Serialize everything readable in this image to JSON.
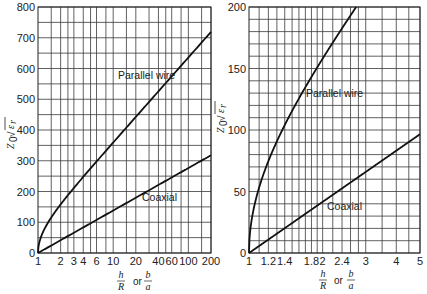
{
  "chart_data": [
    {
      "type": "line",
      "title": "",
      "xlabel": "h/R or b/a",
      "ylabel": "Z0 √εr",
      "xscale": "log",
      "xlim": [
        1,
        200
      ],
      "ylim": [
        0,
        800
      ],
      "grid": true,
      "x_tick_labels": [
        "1",
        "2",
        "3",
        "4",
        "6",
        "10",
        "20",
        "40",
        "60",
        "100",
        "200"
      ],
      "y_tick_labels": [
        "0",
        "100",
        "200",
        "300",
        "400",
        "500",
        "600",
        "700",
        "800"
      ],
      "annotations": [
        "Parallel wire",
        "Coaxial"
      ],
      "x": [
        1,
        1.1,
        1.2,
        1.5,
        2,
        3,
        4,
        6,
        10,
        20,
        40,
        60,
        100,
        200
      ],
      "series": [
        {
          "name": "Parallel wire",
          "values": [
            0,
            53,
            75,
            116,
            158,
            211,
            247,
            297,
            359,
            442,
            525,
            574,
            635,
            718
          ]
        },
        {
          "name": "Coaxial",
          "values": [
            0,
            6,
            11,
            24,
            42,
            66,
            83,
            108,
            138,
            180,
            221,
            246,
            276,
            318
          ]
        }
      ]
    },
    {
      "type": "line",
      "title": "",
      "xlabel": "h/R or b/a",
      "ylabel": "Z0 √εr",
      "xscale": "log",
      "xlim": [
        1,
        5
      ],
      "ylim": [
        0,
        200
      ],
      "grid": true,
      "x_tick_labels": [
        "1",
        "1.2",
        "1.4",
        "1.8",
        "2",
        "2.4",
        "3",
        "4",
        "5"
      ],
      "y_tick_labels": [
        "0",
        "50",
        "100",
        "150",
        "200"
      ],
      "annotations": [
        "Parallel wire",
        "Coaxial"
      ],
      "x": [
        1,
        1.02,
        1.05,
        1.1,
        1.2,
        1.4,
        1.6,
        1.8,
        2,
        2.4,
        2.8,
        3,
        4,
        5
      ],
      "series": [
        {
          "name": "Parallel wire",
          "values": [
            0,
            24,
            38,
            53,
            75,
            104,
            125,
            143,
            158,
            183,
            203,
            211,
            247,
            275
          ]
        },
        {
          "name": "Coaxial",
          "values": [
            0,
            1.2,
            2.9,
            5.7,
            10.9,
            20.2,
            28.2,
            35.3,
            41.6,
            52.5,
            61.8,
            65.9,
            83.2,
            96.6
          ]
        }
      ]
    }
  ],
  "labels": {
    "ylabel_main": "Z",
    "ylabel_sub": "0",
    "ylabel_sqrt": "√",
    "ylabel_eps": "ε",
    "ylabel_eps_sub": "r",
    "x_num_h": "h",
    "x_den_R": "R",
    "x_or": "or",
    "x_num_b": "b",
    "x_den_a": "a",
    "parallel_wire": "Parallel wire",
    "coaxial": "Coaxial"
  }
}
